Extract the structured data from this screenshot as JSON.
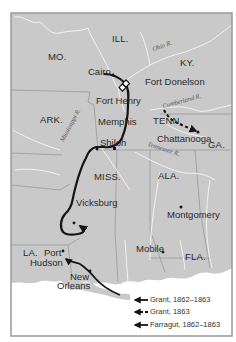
{
  "map": {
    "colors": {
      "land": "#c9c9c9",
      "water": "#ffffff",
      "border_line": "#8a8a8a",
      "river_line": "#f2f2f2",
      "route": "#151515",
      "frame": "#9a9a9a"
    },
    "states": [
      {
        "id": "mo",
        "label": "MO."
      },
      {
        "id": "ill",
        "label": "ILL."
      },
      {
        "id": "ky",
        "label": "KY."
      },
      {
        "id": "ark",
        "label": "ARK."
      },
      {
        "id": "tenn",
        "label": "TENN."
      },
      {
        "id": "ga",
        "label": "GA."
      },
      {
        "id": "miss",
        "label": "MISS."
      },
      {
        "id": "ala",
        "label": "ALA."
      },
      {
        "id": "la",
        "label": "LA."
      },
      {
        "id": "fla",
        "label": "FLA."
      }
    ],
    "cities": [
      {
        "id": "cairo",
        "label": "Cairo"
      },
      {
        "id": "fort-donelson",
        "label": "Fort Donelson"
      },
      {
        "id": "fort-henry",
        "label": "Fort Henry"
      },
      {
        "id": "memphis",
        "label": "Memphis"
      },
      {
        "id": "shiloh",
        "label": "Shiloh"
      },
      {
        "id": "chattanooga",
        "label": "Chattanooga"
      },
      {
        "id": "vicksburg",
        "label": "Vicksburg"
      },
      {
        "id": "montgomery",
        "label": "Montgomery"
      },
      {
        "id": "port-hudson-1",
        "label": "Port"
      },
      {
        "id": "port-hudson-2",
        "label": "Hudson"
      },
      {
        "id": "mobile",
        "label": "Mobile"
      },
      {
        "id": "new-orleans-1",
        "label": "New"
      },
      {
        "id": "new-orleans-2",
        "label": "Orleans"
      }
    ],
    "rivers": [
      {
        "id": "ohio",
        "label": "Ohio R."
      },
      {
        "id": "cumberland",
        "label": "Cumberland R."
      },
      {
        "id": "mississippi",
        "label": "Mississippi R."
      },
      {
        "id": "tennessee",
        "label": "Tennessee R."
      }
    ],
    "legend": [
      {
        "style": "solid",
        "label": "Grant, 1862–1863"
      },
      {
        "style": "dashed",
        "label": "Grant, 1863"
      },
      {
        "style": "solid",
        "label": "Farragut, 1862–1863"
      }
    ]
  }
}
